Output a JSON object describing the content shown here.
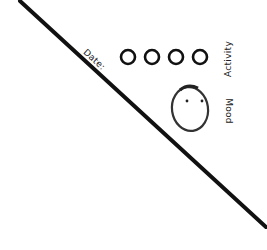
{
  "sketch": {
    "date_label": "Date:",
    "activity_label": "Activity",
    "mood_label": "Mood",
    "activity_dots": [
      {
        "cx": 128,
        "cy": 57
      },
      {
        "cx": 152,
        "cy": 57
      },
      {
        "cx": 176,
        "cy": 57
      },
      {
        "cx": 200,
        "cy": 57
      }
    ],
    "mood_face": {
      "cx": 190,
      "cy": 109,
      "rx": 18,
      "ry": 22
    },
    "divider_line": {
      "x1": 20,
      "y1": 0,
      "x2": 267,
      "y2": 228
    },
    "colors": {
      "stroke": "#111111",
      "face_stroke": "#333333",
      "background": "#ffffff"
    }
  }
}
